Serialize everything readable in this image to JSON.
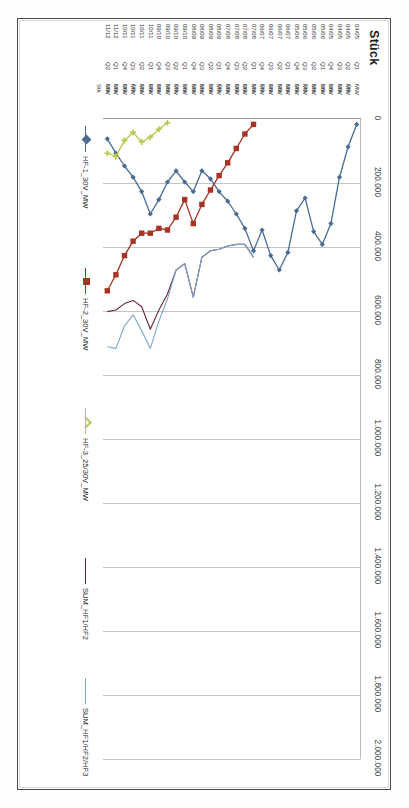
{
  "chart_data": {
    "type": "line",
    "title": "",
    "ylabel": "Stück",
    "xlabel": "",
    "ylim": [
      0,
      2000000
    ],
    "ytick_labels": [
      "0",
      "200.000",
      "400.000",
      "600.000",
      "800.000",
      "1.000.000",
      "1.200.000",
      "1.400.000",
      "1.600.000",
      "1.800.000",
      "2.000.000"
    ],
    "ytick_values": [
      0,
      200000,
      400000,
      600000,
      800000,
      1000000,
      1200000,
      1400000,
      1600000,
      1800000,
      2000000
    ],
    "grid": true,
    "legend_position": "bottom",
    "category_rows": [
      "unit",
      "quarter",
      "period"
    ],
    "categories": [
      {
        "unit": "MW",
        "quarter": "Q1",
        "period": "04/05"
      },
      {
        "unit": "MW",
        "quarter": "Q2",
        "period": "04/05"
      },
      {
        "unit": "MW",
        "quarter": "Q3",
        "period": "04/05"
      },
      {
        "unit": "MW",
        "quarter": "Q4",
        "period": "04/05"
      },
      {
        "unit": "MW",
        "quarter": "Q1",
        "period": "05/06"
      },
      {
        "unit": "MW",
        "quarter": "Q2",
        "period": "05/06"
      },
      {
        "unit": "MW",
        "quarter": "Q3",
        "period": "05/06"
      },
      {
        "unit": "MW",
        "quarter": "Q4",
        "period": "05/06"
      },
      {
        "unit": "MW",
        "quarter": "Q1",
        "period": "06/07"
      },
      {
        "unit": "MW",
        "quarter": "Q2",
        "period": "06/07"
      },
      {
        "unit": "MW",
        "quarter": "Q3",
        "period": "06/07"
      },
      {
        "unit": "MW",
        "quarter": "Q4",
        "period": "06/07"
      },
      {
        "unit": "MW",
        "quarter": "Q1",
        "period": "07/08"
      },
      {
        "unit": "MW",
        "quarter": "Q2",
        "period": "07/08"
      },
      {
        "unit": "MW",
        "quarter": "Q3",
        "period": "07/08"
      },
      {
        "unit": "MW",
        "quarter": "Q4",
        "period": "07/08"
      },
      {
        "unit": "MW",
        "quarter": "Q1",
        "period": "08/09"
      },
      {
        "unit": "MW",
        "quarter": "Q2",
        "period": "08/09"
      },
      {
        "unit": "MW",
        "quarter": "Q3",
        "period": "08/09"
      },
      {
        "unit": "MW",
        "quarter": "Q4",
        "period": "08/09"
      },
      {
        "unit": "MW",
        "quarter": "Q1",
        "period": "09/10"
      },
      {
        "unit": "MW",
        "quarter": "Q2",
        "period": "09/10"
      },
      {
        "unit": "MW",
        "quarter": "Q3",
        "period": "09/10"
      },
      {
        "unit": "MW",
        "quarter": "Q4",
        "period": "09/10"
      },
      {
        "unit": "MW",
        "quarter": "Q1",
        "period": "10/11"
      },
      {
        "unit": "MW",
        "quarter": "Q2",
        "period": "10/11"
      },
      {
        "unit": "MW",
        "quarter": "Q3",
        "period": "10/11"
      },
      {
        "unit": "MW",
        "quarter": "Q4",
        "period": "10/11"
      },
      {
        "unit": "MW",
        "quarter": "Q1",
        "period": "11/12"
      },
      {
        "unit": "MW",
        "quarter": "Q2",
        "period": "11/12"
      }
    ],
    "sub_unit_label": "Stk",
    "series": [
      {
        "name": "HF-1_30V_MW",
        "color": "#4a6b94",
        "marker": "diamond",
        "values": [
          20000,
          90000,
          185000,
          330000,
          395000,
          355000,
          250000,
          290000,
          420000,
          475000,
          430000,
          350000,
          415000,
          345000,
          300000,
          260000,
          230000,
          190000,
          165000,
          230000,
          200000,
          165000,
          200000,
          255000,
          300000,
          230000,
          185000,
          150000,
          110000,
          65000
        ]
      },
      {
        "name": "HF-2_30V_MW",
        "color": "#a83224",
        "marker": "square",
        "values": [
          null,
          null,
          null,
          null,
          null,
          null,
          null,
          null,
          null,
          null,
          null,
          null,
          20000,
          50000,
          95000,
          140000,
          180000,
          225000,
          270000,
          330000,
          255000,
          310000,
          350000,
          345000,
          360000,
          360000,
          385000,
          430000,
          490000,
          540000
        ]
      },
      {
        "name": "HF-3_25/30V_MW",
        "color": "#b6c94b",
        "marker": "plus",
        "values": [
          null,
          null,
          null,
          null,
          null,
          null,
          null,
          null,
          null,
          null,
          null,
          null,
          null,
          null,
          null,
          null,
          null,
          null,
          null,
          null,
          null,
          null,
          15000,
          35000,
          60000,
          75000,
          45000,
          70000,
          120000,
          110000
        ]
      },
      {
        "name": "SUM_HF1/HF2",
        "color": "#6b2438",
        "marker": "none",
        "values": [
          null,
          null,
          null,
          null,
          null,
          null,
          null,
          null,
          null,
          null,
          null,
          null,
          435000,
          395000,
          395000,
          400000,
          410000,
          415000,
          435000,
          560000,
          455000,
          475000,
          550000,
          600000,
          660000,
          590000,
          570000,
          580000,
          600000,
          605000
        ]
      },
      {
        "name": "SUM_HF1/HF2/HF3",
        "color": "#7aa6cc",
        "marker": "none",
        "values": [
          null,
          null,
          null,
          null,
          null,
          null,
          null,
          null,
          null,
          null,
          null,
          null,
          435000,
          395000,
          395000,
          400000,
          410000,
          415000,
          435000,
          560000,
          455000,
          475000,
          565000,
          635000,
          720000,
          665000,
          615000,
          650000,
          720000,
          715000
        ]
      }
    ]
  },
  "legend": {
    "items": [
      {
        "label": "HF-1_30V_MW"
      },
      {
        "label": "HF-2_30V_MW"
      },
      {
        "label": "HF-3_25/30V_MW"
      },
      {
        "label": "SUM_HF1/HF2"
      },
      {
        "label": "SUM_HF1/HF2/HF3"
      }
    ]
  }
}
